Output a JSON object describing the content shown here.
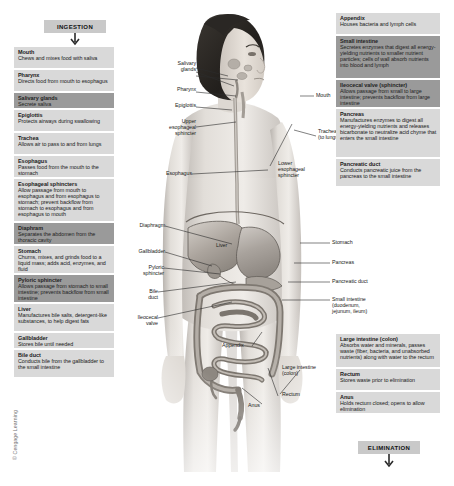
{
  "banners": {
    "ingestion": "INGESTION",
    "elimination": "ELIMINATION"
  },
  "credit": "© Cengage Learning",
  "left_column": [
    {
      "title": "Mouth",
      "desc": "Chews and mixes food with saliva",
      "highlight": false
    },
    {
      "title": "Pharynx",
      "desc": "Directs food from mouth to esophagus",
      "highlight": false
    },
    {
      "title": "Salivary glands",
      "desc": "Secrete saliva",
      "highlight": true
    },
    {
      "title": "Epiglottis",
      "desc": "Protects airways during swallowing",
      "highlight": false
    },
    {
      "title": "Trachea",
      "desc": "Allows air to pass to and from lungs",
      "highlight": false
    },
    {
      "title": "Esophagus",
      "desc": "Passes food from the mouth to the stomach",
      "highlight": false
    },
    {
      "title": "Esophageal sphincters",
      "desc": "Allow passage from mouth to esophagus and from esophagus to stomach; prevent backflow from stomach to esophagus and from esophagus to mouth",
      "highlight": false
    },
    {
      "title": "Diaphram",
      "desc": "Separates the abdomen from the thoracic cavity",
      "highlight": true
    },
    {
      "title": "Stomach",
      "desc": "Churns, mixes, and grinds food to a liquid mass; adds acid, enzymes, and fluid",
      "highlight": false
    },
    {
      "title": "Pyloric sphincter",
      "desc": "Allows passage from stomach to small intestine; prevents backflow from small intestine",
      "highlight": true
    },
    {
      "title": "Liver",
      "desc": "Manufactures bile salts, detergent-like substances, to help digest fats",
      "highlight": false
    },
    {
      "title": "Gallbladder",
      "desc": "Stores bile until needed",
      "highlight": false
    },
    {
      "title": "Bile duct",
      "desc": "Conducts bile from the gallbladder to the small intestine",
      "highlight": false
    }
  ],
  "right_column": [
    {
      "title": "Appendix",
      "desc": "Houses bacteria and lymph cells",
      "highlight": false
    },
    {
      "title": "Small intestine",
      "desc": "Secretes enzymes that digest all energy-yielding nutrients to smaller nutrient particles; cells of wall absorb nutrients into blood and lymph",
      "highlight": true
    },
    {
      "title": "Ileocecal valve (sphincter)",
      "desc": "Allows passage from small to large intestine; prevents backflow from large intestine",
      "highlight": true
    },
    {
      "title": "Pancreas",
      "desc": "Manufactures enzymes to digest all energy-yielding nutrients and releases bicarbonate to neutralize acid chyme that enters the small intestine",
      "highlight": false
    },
    {
      "title": "Pancreatic duct",
      "desc": "Conducts pancreatic juice from the pancreas to the small intestine",
      "highlight": false
    },
    {
      "title": "Large intestine (colon)",
      "desc": "Absorbs water and minerals, passes waste (fiber, bacteria, and unabsorbed nutrients) along with water to the rectum",
      "highlight": false
    },
    {
      "title": "Rectum",
      "desc": "Stores waste prior to elimination",
      "highlight": false
    },
    {
      "title": "Anus",
      "desc": "Holds rectum closed; opens to allow elimination",
      "highlight": false
    }
  ],
  "figure_labels": {
    "left": [
      {
        "text": "Salivary\nglands"
      },
      {
        "text": "Pharynx"
      },
      {
        "text": "Epiglottis"
      },
      {
        "text": "Upper\nesophageal\nsphincter"
      },
      {
        "text": "Esophagus"
      },
      {
        "text": "Diaphragm"
      },
      {
        "text": "Gallbladder"
      },
      {
        "text": "Pyloric\nsphincter"
      },
      {
        "text": "Bile\nduct"
      },
      {
        "text": "Ileocecal\nvalve"
      }
    ],
    "right": [
      {
        "text": "Mouth"
      },
      {
        "text": "Trachea\n(to lungs)"
      },
      {
        "text": "Lower\nesophageal\nsphincter"
      },
      {
        "text": "Stomach"
      },
      {
        "text": "Pancreas"
      },
      {
        "text": "Pancreatic duct"
      },
      {
        "text": "Small intestine\n(duodenum,\njejunum, ileum)"
      }
    ],
    "inner": [
      {
        "text": "Liver"
      },
      {
        "text": "Appendix"
      },
      {
        "text": "Large intestine\n(colon)"
      },
      {
        "text": "Rectum"
      },
      {
        "text": "Anus"
      }
    ]
  },
  "colors": {
    "box_light": "#d9d9d9",
    "box_dark": "#9a9a9a",
    "banner": "#c9c9c9",
    "text": "#1a1a1a",
    "leader": "#2b2b2b",
    "skin": "#d8d4d0"
  }
}
